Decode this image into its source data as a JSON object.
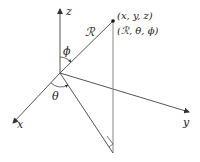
{
  "diagram": {
    "axes": {
      "x_label": "x",
      "y_label": "y",
      "z_label": "z"
    },
    "radius_label": "ℛ",
    "angle_phi_label": "ϕ",
    "angle_theta_label": "θ",
    "point_cartesian_label": "(x, y, z)",
    "point_spherical_label": "(ℛ, θ, ϕ)",
    "colors": {
      "line": "#555555",
      "text": "#222222",
      "background": "#ffffff"
    }
  }
}
